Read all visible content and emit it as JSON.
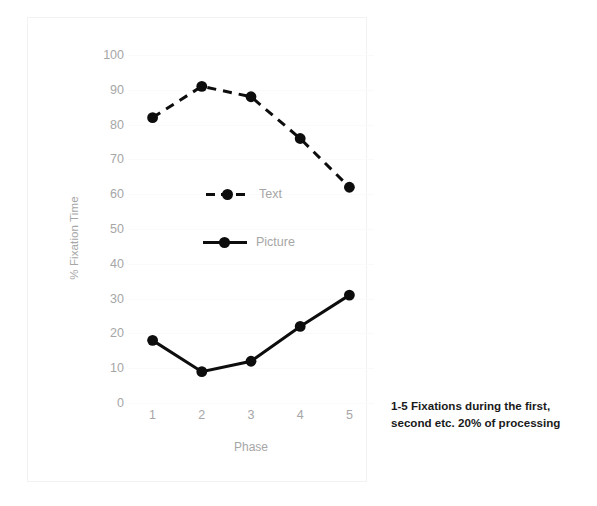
{
  "chart_data": {
    "type": "line",
    "title": "",
    "xlabel": "Phase",
    "ylabel": "% Fixation Time",
    "categories": [
      "1",
      "2",
      "3",
      "4",
      "5"
    ],
    "ylim": [
      0,
      100
    ],
    "ytick_step": 10,
    "yticks": [
      "100",
      "90",
      "80",
      "70",
      "60",
      "50",
      "40",
      "30",
      "20",
      "10",
      "0"
    ],
    "grid": true,
    "legend_position": "inside-center-left",
    "series": [
      {
        "name": "Text",
        "values": [
          82,
          91,
          88,
          76,
          62
        ],
        "style": "dashed",
        "color": "#0d0d0d",
        "marker": "filled-circle"
      },
      {
        "name": "Picture",
        "values": [
          18,
          9,
          12,
          22,
          31
        ],
        "style": "solid",
        "color": "#0d0d0d",
        "marker": "filled-circle"
      }
    ]
  },
  "legend": {
    "items": [
      {
        "label": "Text"
      },
      {
        "label": "Picture"
      }
    ]
  },
  "caption": {
    "line1": "1-5   Fixations during the first,",
    "line2": "second etc. 20% of processing"
  },
  "colors": {
    "series": "#0d0d0d",
    "axis_text": "#a6a6a6",
    "gridline": "#fafafa",
    "frame": "#f2f2f2",
    "caption_text": "#1a1a1a"
  }
}
